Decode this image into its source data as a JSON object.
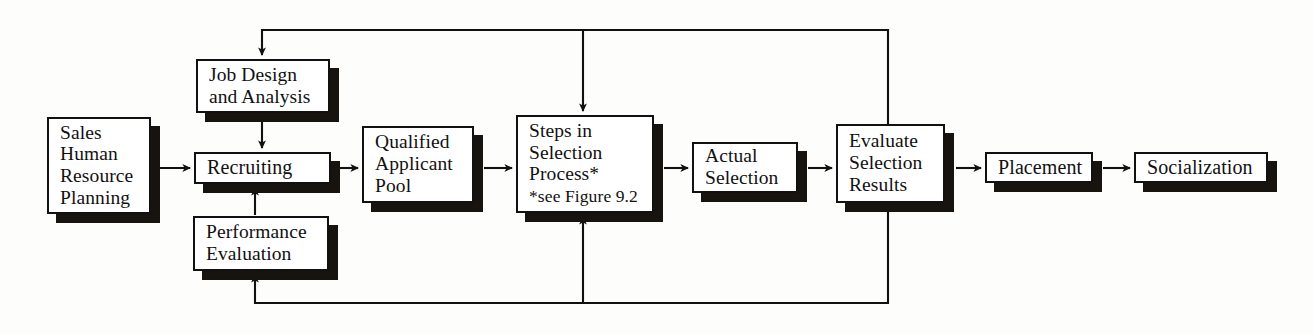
{
  "figure": {
    "type": "flowchart",
    "orientation": "left-to-right",
    "title": "",
    "line_color": "#111111",
    "box_fill": "#ffffff",
    "shadow_color": "#17140f"
  },
  "nodes": [
    {
      "id": "sales-human-resource-planning",
      "name": "sales-human-resource-planning",
      "lines": [
        "Sales",
        "Human",
        "Resource",
        "Planning"
      ],
      "x": 47,
      "y": 117,
      "w": 104,
      "h": 97
    },
    {
      "id": "job-design-and-analysis",
      "name": "job-design-and-analysis",
      "lines": [
        "Job Design",
        "and Analysis"
      ],
      "x": 196,
      "y": 59,
      "w": 134,
      "h": 54
    },
    {
      "id": "recruiting",
      "name": "recruiting",
      "lines": [
        "Recruiting"
      ],
      "x": 194,
      "y": 152,
      "w": 137,
      "h": 32
    },
    {
      "id": "performance-evaluation",
      "name": "performance-evaluation",
      "lines": [
        "Performance",
        "Evaluation"
      ],
      "x": 193,
      "y": 216,
      "w": 136,
      "h": 55
    },
    {
      "id": "qualified-applicant-pool",
      "name": "qualified-applicant-pool",
      "lines": [
        "Qualified",
        "Applicant",
        "Pool"
      ],
      "x": 362,
      "y": 126,
      "w": 112,
      "h": 77
    },
    {
      "id": "steps-in-selection-process",
      "name": "steps-in-selection-process",
      "lines": [
        "Steps in",
        "Selection",
        "Process*"
      ],
      "note": "*see Figure 9.2",
      "x": 516,
      "y": 115,
      "w": 138,
      "h": 98
    },
    {
      "id": "actual-selection",
      "name": "actual-selection",
      "lines": [
        "Actual",
        "Selection"
      ],
      "x": 692,
      "y": 142,
      "w": 106,
      "h": 51
    },
    {
      "id": "evaluate-selection-results",
      "name": "evaluate-selection-results",
      "lines": [
        "Evaluate",
        "Selection",
        "Results"
      ],
      "x": 836,
      "y": 124,
      "w": 109,
      "h": 79
    },
    {
      "id": "placement",
      "name": "placement",
      "lines": [
        "Placement"
      ],
      "x": 985,
      "y": 152,
      "w": 108,
      "h": 31
    },
    {
      "id": "socialization",
      "name": "socialization",
      "lines": [
        "Socialization"
      ],
      "x": 1134,
      "y": 152,
      "w": 134,
      "h": 31
    }
  ],
  "connectors": [
    {
      "name": "arrow-planning-to-recruiting",
      "from": "sales-human-resource-planning",
      "to": "recruiting",
      "kind": "arrow-right"
    },
    {
      "name": "arrow-job-design-to-recruiting",
      "from": "job-design-and-analysis",
      "to": "recruiting",
      "kind": "arrow-down"
    },
    {
      "name": "arrow-performance-evaluation-to-recruiting",
      "from": "performance-evaluation",
      "to": "recruiting",
      "kind": "arrow-up"
    },
    {
      "name": "arrow-recruiting-to-qualified-applicant-pool",
      "from": "recruiting",
      "to": "qualified-applicant-pool",
      "kind": "arrow-right"
    },
    {
      "name": "arrow-qualified-applicant-pool-to-steps",
      "from": "qualified-applicant-pool",
      "to": "steps-in-selection-process",
      "kind": "arrow-right"
    },
    {
      "name": "arrow-steps-to-actual-selection",
      "from": "steps-in-selection-process",
      "to": "actual-selection",
      "kind": "arrow-right"
    },
    {
      "name": "arrow-actual-selection-to-evaluate",
      "from": "actual-selection",
      "to": "evaluate-selection-results",
      "kind": "arrow-right"
    },
    {
      "name": "arrow-evaluate-to-placement",
      "from": "evaluate-selection-results",
      "to": "placement",
      "kind": "arrow-right"
    },
    {
      "name": "arrow-placement-to-socialization",
      "from": "placement",
      "to": "socialization",
      "kind": "arrow-right"
    },
    {
      "name": "feedback-top-to-job-design",
      "from": "evaluate-selection-results",
      "to": "job-design-and-analysis",
      "kind": "feedback-loop-top"
    },
    {
      "name": "feedback-top-to-steps",
      "from": "evaluate-selection-results",
      "to": "steps-in-selection-process",
      "kind": "feedback-branch-top"
    },
    {
      "name": "feedback-bottom-to-performance-evaluation",
      "from": "evaluate-selection-results",
      "to": "performance-evaluation",
      "kind": "feedback-loop-bottom"
    },
    {
      "name": "feedback-bottom-to-steps",
      "from": "evaluate-selection-results",
      "to": "steps-in-selection-process",
      "kind": "feedback-branch-bottom"
    }
  ]
}
